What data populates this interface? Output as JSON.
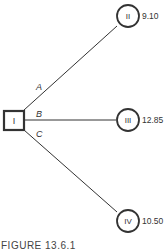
{
  "diagram": {
    "decision_node": {
      "label": "I"
    },
    "branches": [
      {
        "label": "A",
        "target": "II",
        "value": "9.10"
      },
      {
        "label": "B",
        "target": "III",
        "value": "12.85"
      },
      {
        "label": "C",
        "target": "IV",
        "value": "10.50"
      }
    ],
    "caption": "FIGURE 13.6.1"
  }
}
